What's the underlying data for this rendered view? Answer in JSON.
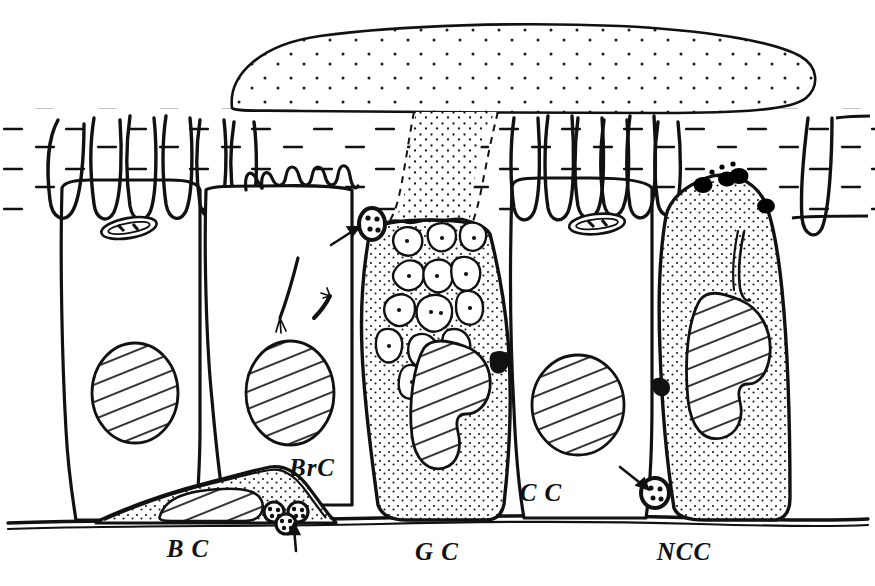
{
  "figure": {
    "ink_color": "#111111",
    "background_color": "#ffffff",
    "stipple_color": "#1a1a1a",
    "granule_color": "#000000"
  },
  "labels": [
    {
      "id": "bc",
      "text": "B C",
      "x": 188,
      "y": 557,
      "name": "label-basal-cell"
    },
    {
      "id": "brc",
      "text": "BrC",
      "x": 312,
      "y": 476,
      "name": "label-brush-cell"
    },
    {
      "id": "gc",
      "text": "G C",
      "x": 437,
      "y": 560,
      "name": "label-goblet-cell"
    },
    {
      "id": "cc",
      "text": "C C",
      "x": 541,
      "y": 501,
      "name": "label-ciliated-cell"
    },
    {
      "id": "ncc",
      "text": "NCC",
      "x": 684,
      "y": 560,
      "name": "label-nonciliated-cell"
    }
  ],
  "structures": {
    "mucus_blanket": "mucus blanket",
    "periciliary_layer": "periciliary fluid layer",
    "basement_membrane": "basement membrane",
    "cilia": "cilia",
    "microvilli": "microvilli",
    "mucus_granules": "mucus granules",
    "nucleus": "nucleus",
    "mitochondrion": "mitochondrion",
    "tight_junction": "tight junction",
    "dense_core_granules": "dense core granules",
    "nerve_endings": "nerve endings"
  },
  "annotations": [
    {
      "id": "arrow-tj",
      "name": "arrow-tight-junction-goblet",
      "x1": 331,
      "y1": 245,
      "x2": 359,
      "y2": 228
    },
    {
      "id": "arrow-basal",
      "name": "arrow-basal-granules",
      "x1": 296,
      "y1": 551,
      "x2": 294,
      "y2": 524
    },
    {
      "id": "arrow-ncc",
      "name": "arrow-tight-junction-ncc",
      "x1": 620,
      "y1": 467,
      "x2": 648,
      "y2": 489
    }
  ]
}
